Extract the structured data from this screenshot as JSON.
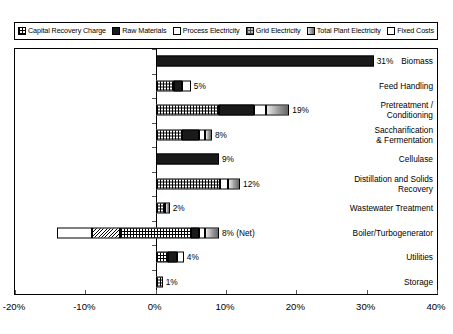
{
  "legend": {
    "items": [
      {
        "label": "Capital Recovery Charge",
        "pattern": "p-capital",
        "icon": "checker-swatch-icon"
      },
      {
        "label": "Raw Materials",
        "pattern": "p-raw",
        "icon": "solid-black-swatch-icon"
      },
      {
        "label": "Process Electricity",
        "pattern": "p-process",
        "icon": "white-swatch-icon"
      },
      {
        "label": "Grid Electricity",
        "pattern": "p-grid",
        "icon": "gray-checker-swatch-icon"
      },
      {
        "label": "Total Plant Electricity",
        "pattern": "p-total",
        "icon": "gradient-swatch-icon"
      },
      {
        "label": "Fixed Costs",
        "pattern": "p-fixed",
        "icon": "bold-checker-swatch-icon"
      }
    ]
  },
  "chart_data": {
    "type": "bar",
    "orientation": "horizontal",
    "stacked": true,
    "title": "",
    "xlabel": "",
    "ylabel": "",
    "xlim": [
      -20,
      40
    ],
    "xticks": [
      -20,
      -10,
      0,
      10,
      20,
      30,
      40
    ],
    "xticklabels": [
      "-20%",
      "-10%",
      "0%",
      "10%",
      "20%",
      "30%",
      "40%"
    ],
    "grid": false,
    "legend_position": "top",
    "series_names": [
      "Capital Recovery Charge",
      "Raw Materials",
      "Process Electricity",
      "Grid Electricity",
      "Total Plant Electricity",
      "Fixed Costs"
    ],
    "categories": [
      "Biomass",
      "Feed Handling",
      "Pretreatment / Conditioning",
      "Saccharification & Fermentation",
      "Cellulase",
      "Distillation and Solids Recovery",
      "Wastewater Treatment",
      "Boiler/Turbogenerator",
      "Utilities",
      "Storage"
    ],
    "bars": [
      {
        "category": "Biomass",
        "label_lines": [
          "Biomass"
        ],
        "start": 0,
        "total": 31,
        "value_label": "31%",
        "segments": [
          {
            "series": "Raw Materials",
            "pattern": "p-raw",
            "width": 31
          }
        ]
      },
      {
        "category": "Feed Handling",
        "label_lines": [
          "Feed Handling"
        ],
        "start": 0,
        "total": 5,
        "value_label": "5%",
        "segments": [
          {
            "series": "Capital Recovery Charge",
            "pattern": "p-capital",
            "width": 2.6
          },
          {
            "series": "Raw Materials",
            "pattern": "p-raw",
            "width": 1.2
          },
          {
            "series": "Process Electricity",
            "pattern": "p-process",
            "width": 1.2
          }
        ]
      },
      {
        "category": "Pretreatment / Conditioning",
        "label_lines": [
          "Pretreatment /",
          "Conditioning"
        ],
        "start": 0,
        "total": 19,
        "value_label": "19%",
        "segments": [
          {
            "series": "Capital Recovery Charge",
            "pattern": "p-capital",
            "width": 9.0
          },
          {
            "series": "Raw Materials",
            "pattern": "p-raw",
            "width": 5.0
          },
          {
            "series": "Process Electricity",
            "pattern": "p-process",
            "width": 1.7
          },
          {
            "series": "Total Plant Electricity",
            "pattern": "p-total",
            "width": 3.3
          }
        ]
      },
      {
        "category": "Saccharification & Fermentation",
        "label_lines": [
          "Saccharification",
          "& Fermentation"
        ],
        "start": 0,
        "total": 8,
        "value_label": "8%",
        "segments": [
          {
            "series": "Capital Recovery Charge",
            "pattern": "p-capital",
            "width": 3.8
          },
          {
            "series": "Raw Materials",
            "pattern": "p-raw",
            "width": 2.3
          },
          {
            "series": "Process Electricity",
            "pattern": "p-process",
            "width": 0.9
          },
          {
            "series": "Total Plant Electricity",
            "pattern": "p-total",
            "width": 1.0
          }
        ]
      },
      {
        "category": "Cellulase",
        "label_lines": [
          "Cellulase"
        ],
        "start": 0,
        "total": 9,
        "value_label": "9%",
        "segments": [
          {
            "series": "Raw Materials",
            "pattern": "p-raw",
            "width": 9
          }
        ]
      },
      {
        "category": "Distillation and Solids Recovery",
        "label_lines": [
          "Distillation and Solids",
          "Recovery"
        ],
        "start": 0,
        "total": 12,
        "value_label": "12%",
        "segments": [
          {
            "series": "Capital Recovery Charge",
            "pattern": "p-capital",
            "width": 9.2
          },
          {
            "series": "Process Electricity",
            "pattern": "p-process",
            "width": 1.1
          },
          {
            "series": "Total Plant Electricity",
            "pattern": "p-total",
            "width": 1.7
          }
        ]
      },
      {
        "category": "Wastewater Treatment",
        "label_lines": [
          "Wastewater Treatment"
        ],
        "start": 0,
        "total": 2,
        "value_label": "2%",
        "segments": [
          {
            "series": "Capital Recovery Charge",
            "pattern": "p-capital",
            "width": 1.3
          },
          {
            "series": "Total Plant Electricity",
            "pattern": "p-total",
            "width": 0.7
          }
        ]
      },
      {
        "category": "Boiler/Turbogenerator",
        "label_lines": [
          "Boiler/Turbogenerator"
        ],
        "start": -14,
        "total": 22,
        "value_label": "8% (Net)",
        "segments": [
          {
            "series": "Fixed Costs",
            "pattern": "p-fixed",
            "width": 5.0
          },
          {
            "series": "Grid Electricity",
            "pattern": "p-wave",
            "width": 4.0
          },
          {
            "series": "Capital Recovery Charge",
            "pattern": "p-capital",
            "width": 10.0
          },
          {
            "series": "Raw Materials",
            "pattern": "p-raw",
            "width": 1.2
          },
          {
            "series": "Process Electricity",
            "pattern": "p-process",
            "width": 0.8
          },
          {
            "series": "Total Plant Electricity",
            "pattern": "p-total",
            "width": 2.0
          }
        ]
      },
      {
        "category": "Utilities",
        "label_lines": [
          "Utilities"
        ],
        "start": 0,
        "total": 4,
        "value_label": "4%",
        "segments": [
          {
            "series": "Capital Recovery Charge",
            "pattern": "p-capital",
            "width": 1.7
          },
          {
            "series": "Raw Materials",
            "pattern": "p-raw",
            "width": 1.3
          },
          {
            "series": "Process Electricity",
            "pattern": "p-process",
            "width": 1.0
          }
        ]
      },
      {
        "category": "Storage",
        "label_lines": [
          "Storage"
        ],
        "start": 0,
        "total": 1,
        "value_label": "1%",
        "segments": [
          {
            "series": "Capital Recovery Charge",
            "pattern": "p-capital",
            "width": 1.0
          }
        ]
      }
    ]
  }
}
